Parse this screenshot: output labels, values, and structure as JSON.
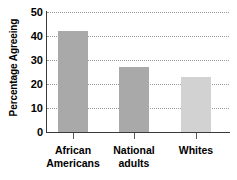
{
  "chart_data": {
    "type": "bar",
    "title": "",
    "xlabel": "",
    "ylabel": "Percentage Agreeing",
    "categories": [
      "African Americans",
      "National adults",
      "Whites"
    ],
    "category_lines": [
      [
        "African",
        "Americans"
      ],
      [
        "National",
        "adults"
      ],
      [
        "Whites",
        ""
      ]
    ],
    "values": [
      42,
      27,
      23
    ],
    "ylim": [
      0,
      50
    ],
    "ytick_labels": [
      "0",
      "10",
      "20",
      "30",
      "40",
      "50"
    ],
    "ytick_values": [
      0,
      10,
      20,
      30,
      40,
      50
    ],
    "grid": true,
    "grid_style": "dotted-horizontal",
    "legend": false,
    "bar_colors": [
      "#a9a9a9",
      "#a9a9a9",
      "#d2d2d2"
    ],
    "axis_color": "#3a3a3a",
    "grid_color": "#9a9a9a",
    "text_color": "#000000",
    "background": "#ffffff"
  }
}
